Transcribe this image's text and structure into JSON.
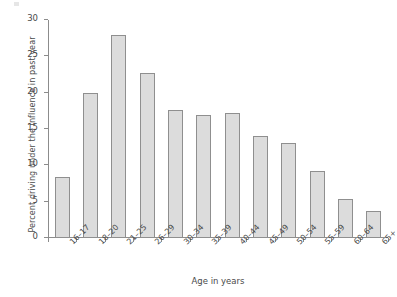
{
  "chart_data": {
    "type": "bar",
    "title": "",
    "xlabel": "Age in years",
    "ylabel": "Percent driving under the influence in past year",
    "categories": [
      "16–17",
      "18–20",
      "21–25",
      "26–29",
      "30–34",
      "35–39",
      "40–44",
      "45–49",
      "50–54",
      "55–59",
      "60–64",
      "65+"
    ],
    "values": [
      8.4,
      19.9,
      28.0,
      22.7,
      17.6,
      16.9,
      17.2,
      14.0,
      13.1,
      9.2,
      5.4,
      3.7
    ],
    "ylim": [
      0,
      30
    ],
    "yticks": [
      0,
      5,
      10,
      15,
      20,
      25,
      30
    ],
    "ytick_labels": [
      "0",
      "5",
      "10",
      "15",
      "20",
      "25",
      "30"
    ],
    "grid": false,
    "legend": null,
    "bar_fill_color": "#dcdcdc",
    "bar_border_color": "#8f8f8f",
    "axis_color": "#8c8c8c",
    "text_color": "#4a4a4a",
    "background_color": "#ffffff"
  }
}
